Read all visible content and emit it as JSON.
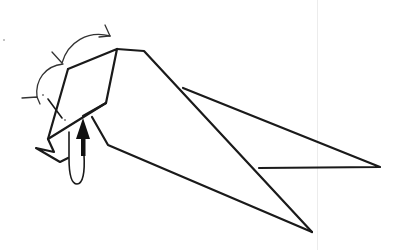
{
  "diagram": {
    "type": "origami-folding-step",
    "colors": {
      "background": "#ffffff",
      "line": "#1a1a1a",
      "arrow": "#333333",
      "guide": "#ececec",
      "dot": "#777777"
    },
    "guide_line_x": 317,
    "elements": {
      "head_flap": "hexagonal flap",
      "body": "main body outline",
      "tail": "tail point",
      "wing": "upper wing",
      "fold_arrow_large": "curved fold arrow (upper)",
      "fold_arrow_small": "curved fold arrow (left)",
      "push_arrow": "solid black push arrow",
      "loop_arrow": "rotate/loop arrow",
      "beak": "small beak flap"
    }
  }
}
